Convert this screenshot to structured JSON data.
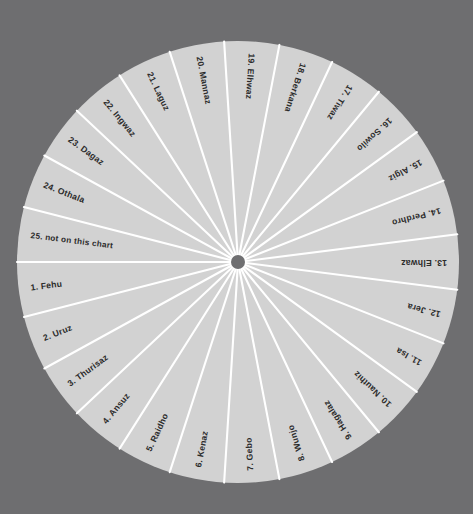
{
  "figure": {
    "kind": "rune-wheel",
    "background_color": "#6e6e70",
    "segment_fill": "#d2d2d2",
    "divider_color": "#ffffff",
    "hub_color": "#6f6f71",
    "label_color": "#2b2b2b",
    "center": {
      "x": 238,
      "y": 262
    },
    "radius": 221,
    "hub_radius": 7,
    "segment_count": 25
  },
  "chart_data": {
    "type": "pie",
    "title": "",
    "subtitle": "",
    "xlabel": "",
    "ylabel": "",
    "legend": "none",
    "grid": false,
    "equal_slices": true,
    "slice_angle_degrees": 14.4,
    "categories": [
      "1. Fehu",
      "2. Uruz",
      "3. Thurisaz",
      "4. Ansuz",
      "5. Raidho",
      "6. Kenaz",
      "7. Gebo",
      "8. Wunjo",
      "9. Hagalaz",
      "10. Nauthiz",
      "11. Isa",
      "12. Jera",
      "13. Elhwaz",
      "14. Perdhro",
      "15. Algiz",
      "16. Sowilo",
      "17. Tiwaz",
      "18. Berkana",
      "19. Elhwaz",
      "20. Mannaz",
      "21. Laguz",
      "22. Ingwaz",
      "23. Dagaz",
      "24. Othala",
      "25. not on this chart"
    ],
    "values": [
      4,
      4,
      4,
      4,
      4,
      4,
      4,
      4,
      4,
      4,
      4,
      4,
      4,
      4,
      4,
      4,
      4,
      4,
      4,
      4,
      4,
      4,
      4,
      4,
      4
    ]
  },
  "segments": [
    {
      "index": 1,
      "label": "1. Fehu",
      "angle": 187.2
    },
    {
      "index": 2,
      "label": "2. Uruz",
      "angle": 201.6
    },
    {
      "index": 3,
      "label": "3. Thurisaz",
      "angle": 216.0
    },
    {
      "index": 4,
      "label": "4. Ansuz",
      "angle": 230.4
    },
    {
      "index": 5,
      "label": "5. Raidho",
      "angle": 244.8
    },
    {
      "index": 6,
      "label": "6. Kenaz",
      "angle": 259.2
    },
    {
      "index": 7,
      "label": "7. Gebo",
      "angle": 273.6
    },
    {
      "index": 8,
      "label": "8. Wunjo",
      "angle": 288.0
    },
    {
      "index": 9,
      "label": "9. Hagalaz",
      "angle": 302.4
    },
    {
      "index": 10,
      "label": "10. Nauthiz",
      "angle": 316.8
    },
    {
      "index": 11,
      "label": "11. Isa",
      "angle": 331.2
    },
    {
      "index": 12,
      "label": "12. Jera",
      "angle": 345.6
    },
    {
      "index": 13,
      "label": "13. Elhwaz",
      "angle": 0.0
    },
    {
      "index": 14,
      "label": "14. Perdhro",
      "angle": 14.4
    },
    {
      "index": 15,
      "label": "15. Algiz",
      "angle": 28.8
    },
    {
      "index": 16,
      "label": "16. Sowilo",
      "angle": 43.2
    },
    {
      "index": 17,
      "label": "17. Tiwaz",
      "angle": 57.6
    },
    {
      "index": 18,
      "label": "18. Berkana",
      "angle": 72.0
    },
    {
      "index": 19,
      "label": "19. Elhwaz",
      "angle": 86.4
    },
    {
      "index": 20,
      "label": "20. Mannaz",
      "angle": 100.8
    },
    {
      "index": 21,
      "label": "21. Laguz",
      "angle": 115.2
    },
    {
      "index": 22,
      "label": "22. Ingwaz",
      "angle": 129.6
    },
    {
      "index": 23,
      "label": "23. Dagaz",
      "angle": 144.0
    },
    {
      "index": 24,
      "label": "24. Othala",
      "angle": 158.4
    },
    {
      "index": 25,
      "label": "25. not on this chart",
      "angle": 172.8
    }
  ]
}
